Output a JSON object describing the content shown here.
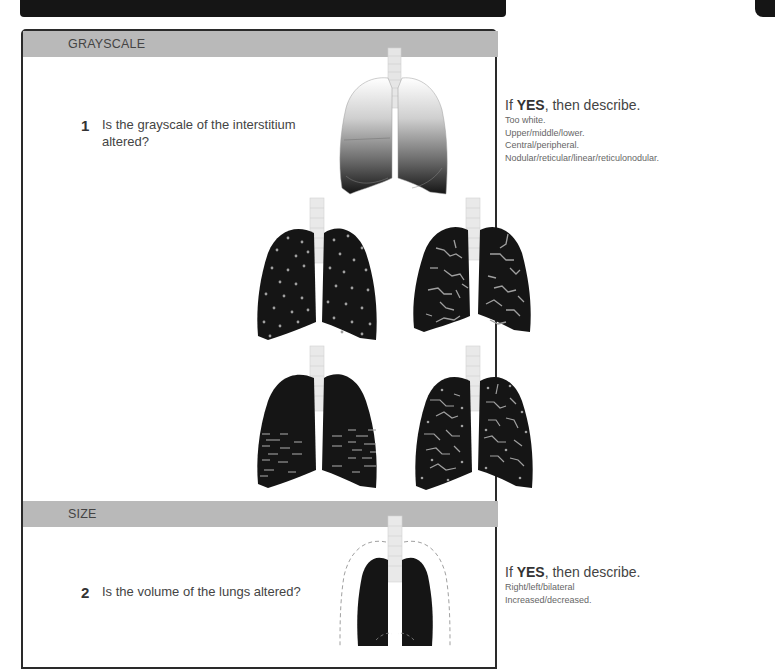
{
  "banner": {
    "color": "#151515"
  },
  "sections": [
    {
      "header": "GRAYSCALE",
      "question_number": "1",
      "question_text": "Is the grayscale of the interstitium altered?",
      "description": {
        "prefix": "If ",
        "emphasis": "YES",
        "suffix": ", then describe.",
        "lines": [
          "Too white.",
          "Upper/middle/lower.",
          "Central/peripheral.",
          "Nodular/reticular/linear/reticulonodular."
        ]
      },
      "illustrations": [
        {
          "name": "gradient-lungs",
          "pattern": "grayscale-gradient"
        },
        {
          "name": "nodular-lungs",
          "pattern": "nodular"
        },
        {
          "name": "reticular-lungs",
          "pattern": "reticular"
        },
        {
          "name": "linear-lungs",
          "pattern": "linear"
        },
        {
          "name": "reticulonodular-lungs",
          "pattern": "reticulonodular"
        }
      ]
    },
    {
      "header": "SIZE",
      "question_number": "2",
      "question_text": "Is the volume of the lungs altered?",
      "description": {
        "prefix": "If ",
        "emphasis": "YES",
        "suffix": ", then describe.",
        "lines": [
          "Right/left/bilateral",
          "Increased/decreased."
        ]
      },
      "illustrations": [
        {
          "name": "size-lungs",
          "pattern": "dashed-outline"
        }
      ]
    }
  ],
  "colors": {
    "header_bg": "#b9b9b9",
    "panel_border": "#2a2a2a",
    "lung_fill": "#151515",
    "pattern_stroke": "#a8a8a8"
  }
}
